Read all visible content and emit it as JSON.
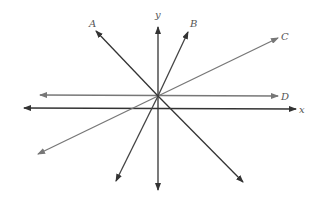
{
  "diagram": {
    "origin": [
      158,
      96
    ],
    "axes": {
      "x": {
        "label": "x",
        "from": [
          24,
          108
        ],
        "to": [
          296,
          109
        ],
        "color": "#333333"
      },
      "y": {
        "label": "y",
        "from": [
          158,
          190
        ],
        "to": [
          158,
          27
        ],
        "color": "#333333"
      }
    },
    "lines": [
      {
        "label": "A",
        "from": [
          243,
          182
        ],
        "to": [
          96,
          31
        ],
        "color": "#333333",
        "label_pos": [
          92,
          25
        ]
      },
      {
        "label": "B",
        "from": [
          116,
          181
        ],
        "to": [
          188,
          32
        ],
        "color": "#444444",
        "label_pos": [
          193,
          24
        ]
      },
      {
        "label": "C",
        "from": [
          38,
          154
        ],
        "to": [
          278,
          38
        ],
        "color": "#777777",
        "label_pos": [
          284,
          38
        ]
      },
      {
        "label": "D",
        "from": [
          40,
          95
        ],
        "to": [
          278,
          96
        ],
        "color": "#777777",
        "label_pos": [
          284,
          99
        ]
      }
    ],
    "axis_label_positions": {
      "x": [
        299,
        113
      ],
      "y": [
        156,
        17
      ]
    }
  }
}
